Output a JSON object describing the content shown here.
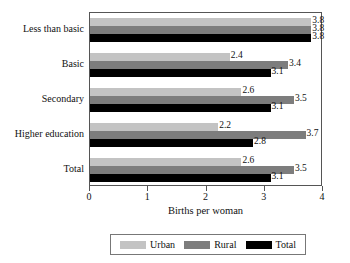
{
  "chart_data": {
    "type": "bar",
    "orientation": "horizontal",
    "title": "",
    "xlabel": "Births per woman",
    "ylabel": "",
    "xlim": [
      0,
      4
    ],
    "xticks": [
      0,
      1,
      2,
      3,
      4
    ],
    "xtick_labels": [
      "0",
      "1",
      "2",
      "3",
      "4"
    ],
    "grid": false,
    "legend_position": "bottom",
    "categories": [
      "Less than basic",
      "Basic",
      "Secondary",
      "Higher education",
      "Total"
    ],
    "series": [
      {
        "name": "Urban",
        "color": "#c3c3c3",
        "values": [
          3.8,
          2.4,
          2.6,
          2.2,
          2.6
        ]
      },
      {
        "name": "Rural",
        "color": "#7d7d7d",
        "values": [
          3.8,
          3.4,
          3.5,
          3.7,
          3.5
        ]
      },
      {
        "name": "Total",
        "color": "#000000",
        "values": [
          3.8,
          3.1,
          3.1,
          2.8,
          3.1
        ]
      }
    ],
    "data_labels": [
      [
        "3.8",
        "2.4",
        "2.6",
        "2.2",
        "2.6"
      ],
      [
        "3.8",
        "3.4",
        "3.5",
        "3.7",
        "3.5"
      ],
      [
        "3.8",
        "3.1",
        "3.1",
        "2.8",
        "3.1"
      ]
    ]
  },
  "legend": {
    "items": [
      {
        "label": "Urban",
        "color": "#c3c3c3"
      },
      {
        "label": "Rural",
        "color": "#7d7d7d"
      },
      {
        "label": "Total",
        "color": "#000000"
      }
    ]
  },
  "axis": {
    "x_title": "Births per woman",
    "tick_labels": [
      "0",
      "1",
      "2",
      "3",
      "4"
    ]
  },
  "categories": {
    "labels": [
      "Less than basic",
      "Basic",
      "Secondary",
      "Higher education",
      "Total"
    ]
  }
}
